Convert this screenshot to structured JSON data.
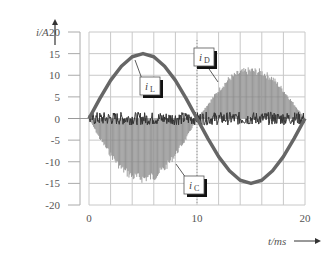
{
  "chart_data": {
    "type": "line",
    "title": "",
    "xlabel": "t/ms",
    "ylabel": "i/A",
    "xlim": [
      0,
      20
    ],
    "ylim": [
      -20,
      20
    ],
    "x_ticks": [
      0,
      10,
      20
    ],
    "y_ticks": [
      20,
      15,
      10,
      5,
      0,
      -5,
      -10,
      -15,
      -20
    ],
    "grid": true,
    "grid_x_step": 2,
    "grid_y_step": 5,
    "legend": "annotation callouts",
    "annotations": [
      {
        "label": "iL",
        "text_main": "i",
        "text_sub": "L",
        "points_to": "inductor current sinusoid peak region"
      },
      {
        "label": "iD",
        "text_main": "i",
        "text_sub": "D",
        "points_to": "diode current envelope second half-cycle"
      },
      {
        "label": "iC",
        "text_main": "i",
        "text_sub": "C",
        "points_to": "capacitor current envelope first half-cycle"
      }
    ],
    "series": [
      {
        "name": "iL",
        "description": "rectified-like sinusoid: positive half 0-10ms, negative half 10-20ms",
        "x": [
          0,
          1,
          2,
          3,
          4,
          5,
          6,
          7,
          8,
          9,
          10,
          11,
          12,
          13,
          14,
          15,
          16,
          17,
          18,
          19,
          20
        ],
        "values": [
          0,
          4.6,
          8.8,
          12.1,
          14.3,
          15,
          14.3,
          12.1,
          8.8,
          4.6,
          0,
          -4.6,
          -8.8,
          -12.1,
          -14.3,
          -15,
          -14.3,
          -12.1,
          -8.8,
          -4.6,
          0
        ]
      },
      {
        "name": "iD",
        "description": "high-frequency pulses with envelope peak ~12A during 10-20ms",
        "x": [
          10,
          11,
          12,
          13,
          14,
          15,
          16,
          17,
          18,
          19,
          20
        ],
        "envelope": [
          0,
          3.5,
          7,
          10,
          11.5,
          12,
          11.5,
          10,
          7,
          3.5,
          0
        ]
      },
      {
        "name": "iC",
        "description": "high-frequency pulses with negative envelope to ~-15A during 0-10ms",
        "x": [
          0,
          1,
          2,
          3,
          4,
          5,
          6,
          7,
          8,
          9,
          10
        ],
        "envelope": [
          0,
          -5,
          -9,
          -12.5,
          -14.5,
          -15,
          -14.5,
          -12.5,
          -9,
          -5,
          0
        ]
      },
      {
        "name": "noise band",
        "description": "dense ripple band around 0 A, roughly ±1.5 A, full 0-20ms"
      }
    ]
  },
  "labels": {
    "y_axis": "i/A",
    "x_axis": "t/ms →",
    "y_ticks": [
      "20",
      "15",
      "10",
      "5",
      "0",
      "-5",
      "-10",
      "-15",
      "-20"
    ],
    "x_ticks": [
      "0",
      "10",
      "20"
    ]
  }
}
